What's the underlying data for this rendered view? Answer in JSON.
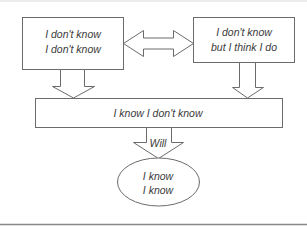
{
  "diagram": {
    "type": "flow",
    "colors": {
      "stroke": "#6b6b6b",
      "text": "#3a3a3a",
      "rule": "#888888",
      "background": "#ffffff"
    },
    "nodes": {
      "unconscious_incompetence": {
        "line1": "I don't know",
        "line2": "I don't know"
      },
      "illusory_competence": {
        "line1": "I don't know",
        "line2": "but I think I do"
      },
      "conscious_incompetence": {
        "label": "I know I don't know"
      },
      "conscious_competence": {
        "line1": "I know",
        "line2": "I know"
      }
    },
    "edges": {
      "top_link": {
        "type": "double-arrow",
        "from": "unconscious_incompetence",
        "to": "illusory_competence"
      },
      "left_down": {
        "type": "block-arrow",
        "from": "unconscious_incompetence",
        "to": "conscious_incompetence"
      },
      "right_down": {
        "type": "block-arrow",
        "from": "illusory_competence",
        "to": "conscious_incompetence"
      },
      "will": {
        "type": "block-arrow",
        "from": "conscious_incompetence",
        "to": "conscious_competence",
        "label": "Will"
      }
    }
  }
}
